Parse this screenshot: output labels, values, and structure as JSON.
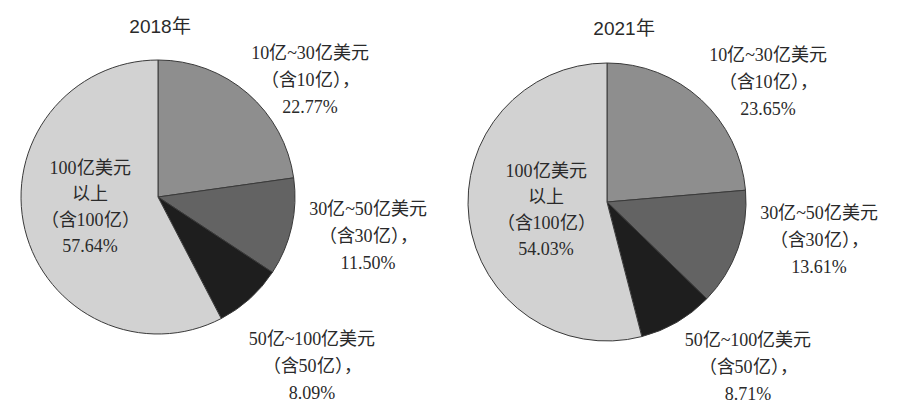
{
  "chart_data": [
    {
      "type": "pie",
      "title": "2018年",
      "start": "top, clockwise",
      "slices": [
        {
          "label_lines": [
            "10亿~30亿美元",
            "（含10亿），",
            "22.77%"
          ],
          "category": "10亿~30亿美元（含10亿）",
          "value": 22.77,
          "color": "#8e8e8e"
        },
        {
          "label_lines": [
            "30亿~50亿美元",
            "（含30亿），",
            "11.50%"
          ],
          "category": "30亿~50亿美元（含30亿）",
          "value": 11.5,
          "color": "#636363"
        },
        {
          "label_lines": [
            "50亿~100亿美元",
            "（含50亿），",
            "8.09%"
          ],
          "category": "50亿~100亿美元（含50亿）",
          "value": 8.09,
          "color": "#1e1e1e"
        },
        {
          "label_lines": [
            "100亿美元",
            "以上",
            "（含100亿）",
            "57.64%"
          ],
          "category": "100亿美元以上（含100亿）",
          "value": 57.64,
          "color": "#d2d2d2"
        }
      ]
    },
    {
      "type": "pie",
      "title": "2021年",
      "start": "top, clockwise",
      "slices": [
        {
          "label_lines": [
            "10亿~30亿美元",
            "（含10亿），",
            "23.65%"
          ],
          "category": "10亿~30亿美元（含10亿）",
          "value": 23.65,
          "color": "#8e8e8e"
        },
        {
          "label_lines": [
            "30亿~50亿美元",
            "（含30亿），",
            "13.61%"
          ],
          "category": "30亿~50亿美元（含30亿）",
          "value": 13.61,
          "color": "#636363"
        },
        {
          "label_lines": [
            "50亿~100亿美元",
            "（含50亿），",
            "8.71%"
          ],
          "category": "50亿~100亿美元（含50亿）",
          "value": 8.71,
          "color": "#1e1e1e"
        },
        {
          "label_lines": [
            "100亿美元",
            "以上",
            "（含100亿）",
            "54.03%"
          ],
          "category": "100亿美元以上（含100亿）",
          "value": 54.03,
          "color": "#d2d2d2"
        }
      ]
    }
  ]
}
